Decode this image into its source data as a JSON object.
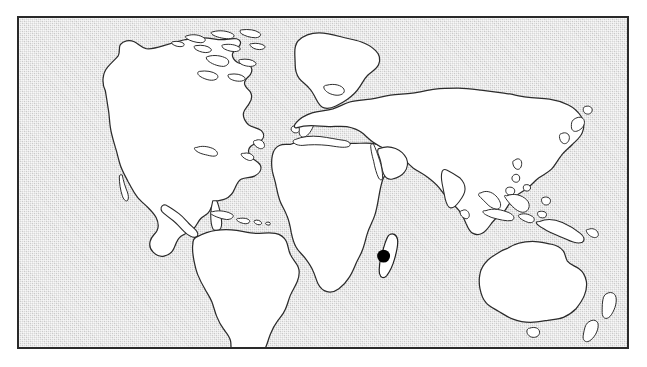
{
  "figure": {
    "kind": "distribution-map",
    "projection": "equirectangular",
    "frame": {
      "x": 17,
      "y": 16,
      "width": 612,
      "height": 333,
      "border_color": "#2a2a2a",
      "border_width_px": 2
    },
    "ocean": {
      "label": "ocean",
      "fill_color": "#d8d8d8",
      "texture": "stipple-halftone"
    },
    "land": {
      "label": "land",
      "fill_color": "#ffffff",
      "outline_color": "#2b2b2b"
    },
    "highlight": {
      "label": "Madagascar",
      "fill_color": "#000000",
      "marker_shape": "filled-circle",
      "marker_x": 384,
      "marker_y": 257,
      "marker_radius": 6.5
    },
    "caption": ""
  },
  "regions": [
    {
      "name": "north-america",
      "label": "North America"
    },
    {
      "name": "greenland",
      "label": "Greenland"
    },
    {
      "name": "canadian-arctic-islands",
      "label": "Canadian Arctic Archipelago"
    },
    {
      "name": "iceland",
      "label": "Iceland"
    },
    {
      "name": "british-isles",
      "label": "British Isles"
    },
    {
      "name": "central-america",
      "label": "Central America"
    },
    {
      "name": "caribbean-islands",
      "label": "Caribbean Islands"
    },
    {
      "name": "south-america",
      "label": "South America"
    },
    {
      "name": "africa",
      "label": "Africa"
    },
    {
      "name": "eurasia",
      "label": "Eurasia"
    },
    {
      "name": "arabian-peninsula",
      "label": "Arabian Peninsula"
    },
    {
      "name": "india",
      "label": "India"
    },
    {
      "name": "japan",
      "label": "Japan"
    },
    {
      "name": "philippines",
      "label": "Philippines"
    },
    {
      "name": "indonesia",
      "label": "Indonesia"
    },
    {
      "name": "new-guinea",
      "label": "New Guinea"
    },
    {
      "name": "australia",
      "label": "Australia"
    },
    {
      "name": "new-zealand",
      "label": "New Zealand"
    },
    {
      "name": "sri-lanka",
      "label": "Sri Lanka"
    },
    {
      "name": "madagascar",
      "label": "Madagascar"
    }
  ]
}
